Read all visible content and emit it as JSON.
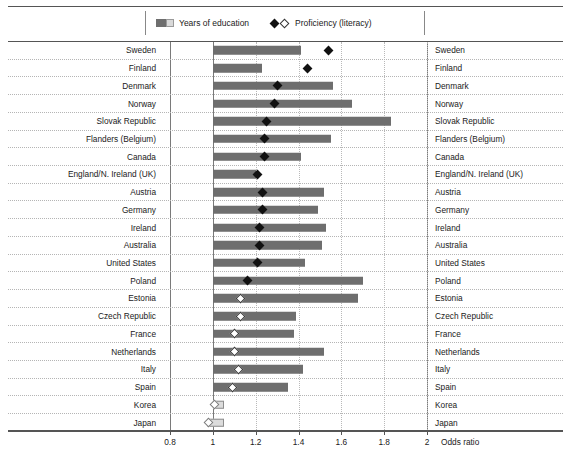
{
  "legend": {
    "bar_label": "Years of education",
    "marker_label": "Proficiency (literacy)",
    "bar_swatch_icon": "two-tone-bar-swatch",
    "marker_swatch_icon": "filled-and-hollow-diamond"
  },
  "axis": {
    "title": "Odds ratio",
    "ticks": [
      "0.8",
      "1",
      "1.2",
      "1.4",
      "1.6",
      "1.8",
      "2"
    ],
    "min": 0.8,
    "max": 2.0
  },
  "colors": {
    "bar_solid": "#6e6e6e",
    "bar_open": "#dcdcdc",
    "marker_filled": "#111111",
    "marker_open": "#ffffff",
    "gridline": "#b9b9b9",
    "rule": "#555555"
  },
  "chart_data": {
    "type": "bar",
    "title": "",
    "xlabel": "Odds ratio",
    "ylabel": "",
    "xlim": [
      0.8,
      2.0
    ],
    "grid": true,
    "legend_position": "top-center",
    "baseline": 1.0,
    "categories": [
      "Sweden",
      "Finland",
      "Denmark",
      "Norway",
      "Slovak Republic",
      "Flanders (Belgium)",
      "Canada",
      "England/N. Ireland (UK)",
      "Austria",
      "Germany",
      "Ireland",
      "Australia",
      "United States",
      "Poland",
      "Estonia",
      "Czech Republic",
      "France",
      "Netherlands",
      "Italy",
      "Spain",
      "Korea",
      "Japan"
    ],
    "series": [
      {
        "name": "Years of education",
        "values": [
          1.41,
          1.23,
          1.56,
          1.65,
          1.83,
          1.55,
          1.41,
          1.2,
          1.52,
          1.49,
          1.53,
          1.51,
          1.43,
          1.7,
          1.68,
          1.39,
          1.38,
          1.52,
          1.42,
          1.35,
          1.05,
          1.05
        ],
        "style": [
          "solid",
          "solid",
          "solid",
          "solid",
          "solid",
          "solid",
          "solid",
          "solid",
          "solid",
          "solid",
          "solid",
          "solid",
          "solid",
          "solid",
          "solid",
          "solid",
          "solid",
          "solid",
          "solid",
          "solid",
          "open",
          "open"
        ],
        "start": [
          1,
          1,
          1,
          1,
          1,
          1,
          1,
          1,
          1,
          1,
          1,
          1,
          1,
          1,
          1,
          1,
          1,
          1,
          1,
          1,
          1,
          0.975
        ]
      },
      {
        "name": "Proficiency (literacy)",
        "values": [
          1.54,
          1.44,
          1.3,
          1.29,
          1.25,
          1.24,
          1.24,
          1.21,
          1.23,
          1.23,
          1.22,
          1.22,
          1.21,
          1.16,
          1.13,
          1.13,
          1.1,
          1.1,
          1.12,
          1.09,
          1.01,
          0.98
        ],
        "style": [
          "filled",
          "filled",
          "filled",
          "filled",
          "filled",
          "filled",
          "filled",
          "filled",
          "filled",
          "filled",
          "filled",
          "filled",
          "filled",
          "filled",
          "open",
          "open",
          "open",
          "open",
          "open",
          "open",
          "open-lt",
          "open-lt"
        ]
      }
    ]
  }
}
